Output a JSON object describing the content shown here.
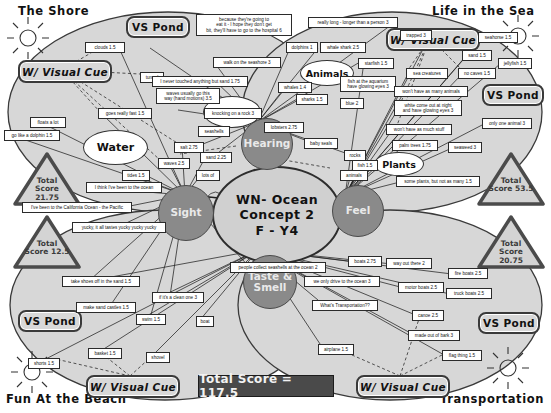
{
  "title": "WN- Ocean Concept 2 F - Y4",
  "corner_titles": [
    {
      "name": "the-shore",
      "label": "The Shore",
      "x": 18,
      "y": 4
    },
    {
      "name": "life-in-the-sea",
      "label": "Life in the Sea",
      "x": 432,
      "y": 4
    },
    {
      "name": "fun-at-the-beach",
      "label": "Fun At the Beach",
      "x": 6,
      "y": 392
    },
    {
      "name": "transportation",
      "label": "Transportation",
      "x": 440,
      "y": 392
    }
  ],
  "hub": {
    "line1": "WN- Ocean",
    "line2": "Concept 2",
    "line3": "F - Y4"
  },
  "senses": [
    {
      "name": "hearing",
      "label": "Hearing",
      "x": 241,
      "y": 118,
      "d": 50
    },
    {
      "name": "sight",
      "label": "Sight",
      "x": 158,
      "y": 185,
      "d": 54
    },
    {
      "name": "feel",
      "label": "Feel",
      "x": 332,
      "y": 185,
      "d": 50
    },
    {
      "name": "taste-and-smell",
      "label": "Taste &\nSmell",
      "x": 243,
      "y": 255,
      "d": 52
    }
  ],
  "concepts": [
    {
      "name": "water",
      "label": "Water",
      "x": 83,
      "y": 130,
      "w": 63,
      "h": 33
    },
    {
      "name": "land",
      "label": "Land",
      "x": 203,
      "y": 96,
      "w": 56,
      "h": 30
    },
    {
      "name": "animals",
      "label": "Animals",
      "x": 300,
      "y": 60,
      "w": 52,
      "h": 24
    },
    {
      "name": "plants",
      "label": "Plants",
      "x": 374,
      "y": 152,
      "w": 48,
      "h": 22
    }
  ],
  "plates": [
    {
      "name": "vs-pond-top-left",
      "label": "VS Pond",
      "x": 126,
      "y": 16,
      "w": 60,
      "h": 18,
      "kind": "vs"
    },
    {
      "name": "visual-cue-top-left",
      "label": "W/ Visual Cue",
      "x": 18,
      "y": 60,
      "w": 90,
      "h": 19,
      "kind": "cue"
    },
    {
      "name": "visual-cue-top-right",
      "label": "W/ Visual Cue",
      "x": 386,
      "y": 28,
      "w": 90,
      "h": 19,
      "kind": "cue"
    },
    {
      "name": "vs-pond-top-right",
      "label": "VS Pond",
      "x": 482,
      "y": 84,
      "w": 58,
      "h": 18,
      "kind": "vs"
    },
    {
      "name": "vs-pond-bottom-left",
      "label": "VS Pond",
      "x": 18,
      "y": 310,
      "w": 60,
      "h": 18,
      "kind": "vs"
    },
    {
      "name": "visual-cue-bottom-left",
      "label": "W/ Visual Cue",
      "x": 86,
      "y": 375,
      "w": 90,
      "h": 19,
      "kind": "cue"
    },
    {
      "name": "visual-cue-bottom-right",
      "label": "W/ Visual Cue",
      "x": 356,
      "y": 375,
      "w": 90,
      "h": 19,
      "kind": "cue"
    },
    {
      "name": "vs-pond-bottom-right",
      "label": "VS Pond",
      "x": 478,
      "y": 312,
      "w": 58,
      "h": 18,
      "kind": "vs"
    }
  ],
  "scores": [
    {
      "name": "score-the-shore",
      "label": "Total\nScore\n21.75",
      "x": 14,
      "y": 152,
      "w": 66,
      "h": 54
    },
    {
      "name": "score-life-in-the-sea",
      "label": "Total\nScore 53.5",
      "x": 478,
      "y": 152,
      "w": 66,
      "h": 54
    },
    {
      "name": "score-fun-at-the-beach",
      "label": "Total\nScore 12.5",
      "x": 14,
      "y": 215,
      "w": 66,
      "h": 54
    },
    {
      "name": "score-transportation",
      "label": "Total\nScore\n20.75",
      "x": 478,
      "y": 215,
      "w": 66,
      "h": 54
    }
  ],
  "banner": {
    "label": "Total Score = 117.5",
    "x": 198,
    "y": 375,
    "w": 134,
    "h": 20
  },
  "labels": [
    {
      "name": "label-clouds",
      "text": "clouds 1.5",
      "x": 85,
      "y": 42,
      "w": 40
    },
    {
      "name": "label-because-hospital",
      "text": "because they're going to\neat it - I hope they don't get\nbit, they'll have to go to the hospital 6",
      "x": 196,
      "y": 14,
      "w": 96
    },
    {
      "name": "label-really-long",
      "text": "really long - longer than a person 3",
      "x": 308,
      "y": 17,
      "w": 90
    },
    {
      "name": "label-trapped",
      "text": "trapped 3",
      "x": 400,
      "y": 30,
      "w": 32
    },
    {
      "name": "label-dolphins",
      "text": "dolphins 1",
      "x": 286,
      "y": 42,
      "w": 32
    },
    {
      "name": "label-whale-shark",
      "text": "whale shark 2.5",
      "x": 320,
      "y": 42,
      "w": 46
    },
    {
      "name": "label-seahorse",
      "text": "seahorse 1.5",
      "x": 478,
      "y": 32,
      "w": 40
    },
    {
      "name": "label-walk-seashore",
      "text": "walk on the seashore 3",
      "x": 213,
      "y": 57,
      "w": 68
    },
    {
      "name": "label-starfish",
      "text": "starfish 1.5",
      "x": 358,
      "y": 58,
      "w": 36
    },
    {
      "name": "label-sand-right",
      "text": "sand 1.5",
      "x": 462,
      "y": 50,
      "w": 30
    },
    {
      "name": "label-jellyfish",
      "text": "jellyfish 1.5",
      "x": 498,
      "y": 58,
      "w": 34
    },
    {
      "name": "label-tunnel",
      "text": "tunnel",
      "x": 140,
      "y": 72,
      "w": 24
    },
    {
      "name": "label-never-touched",
      "text": "I never touched anything but sand 1.75",
      "x": 152,
      "y": 76,
      "w": 96
    },
    {
      "name": "label-sea-creatures",
      "text": "sea creatures",
      "x": 406,
      "y": 68,
      "w": 42
    },
    {
      "name": "label-no-caves",
      "text": "no caves 1.5",
      "x": 458,
      "y": 68,
      "w": 38
    },
    {
      "name": "label-whales",
      "text": "whales 1.4",
      "x": 278,
      "y": 82,
      "w": 34
    },
    {
      "name": "label-aquarium-eyes",
      "text": "fish at the aquarium\nhave glowing eyes 3",
      "x": 340,
      "y": 76,
      "w": 56
    },
    {
      "name": "label-waves-hand",
      "text": "waves usually go this\nway (hand motions) 3.5",
      "x": 156,
      "y": 88,
      "w": 64
    },
    {
      "name": "label-sharks",
      "text": "sharks 1.5",
      "x": 296,
      "y": 94,
      "w": 32
    },
    {
      "name": "label-blue",
      "text": "blue 2",
      "x": 340,
      "y": 98,
      "w": 24
    },
    {
      "name": "label-wont-animals",
      "text": "won't have as many animals",
      "x": 394,
      "y": 86,
      "w": 74
    },
    {
      "name": "label-goes-really-fast",
      "text": "goes really fast 1.5",
      "x": 98,
      "y": 108,
      "w": 54
    },
    {
      "name": "label-knocking-rock",
      "text": "knocking on a rock 3",
      "x": 204,
      "y": 108,
      "w": 58
    },
    {
      "name": "label-white-night",
      "text": "white come out at night\nand have glowing eyes 3",
      "x": 394,
      "y": 100,
      "w": 68
    },
    {
      "name": "label-floats-a-lot",
      "text": "floats a lot",
      "x": 30,
      "y": 117,
      "w": 36
    },
    {
      "name": "label-only-one-animal",
      "text": "only one animal 3",
      "x": 482,
      "y": 118,
      "w": 50
    },
    {
      "name": "label-lobsters",
      "text": "lobsters 2.75",
      "x": 264,
      "y": 122,
      "w": 40
    },
    {
      "name": "label-seashells",
      "text": "seashells",
      "x": 198,
      "y": 126,
      "w": 32
    },
    {
      "name": "label-go-like-dolphin",
      "text": "go like a dolphin 1.5",
      "x": 4,
      "y": 130,
      "w": 56
    },
    {
      "name": "label-baby-seals",
      "text": "baby seals",
      "x": 304,
      "y": 138,
      "w": 34
    },
    {
      "name": "label-wont-much-stuff",
      "text": "won't have as much stuff",
      "x": 386,
      "y": 124,
      "w": 66
    },
    {
      "name": "label-salt",
      "text": "salt 2.75",
      "x": 174,
      "y": 142,
      "w": 30
    },
    {
      "name": "label-rocks",
      "text": "rocks",
      "x": 344,
      "y": 150,
      "w": 22
    },
    {
      "name": "label-palm-trees",
      "text": "palm trees 1.75",
      "x": 392,
      "y": 140,
      "w": 46
    },
    {
      "name": "label-fish",
      "text": "fish 1.5",
      "x": 352,
      "y": 160,
      "w": 26
    },
    {
      "name": "label-seaweed",
      "text": "seaweed 3",
      "x": 448,
      "y": 142,
      "w": 34
    },
    {
      "name": "label-sand-middle",
      "text": "sand 2.25",
      "x": 200,
      "y": 152,
      "w": 32
    },
    {
      "name": "label-waves",
      "text": "waves 2.5",
      "x": 158,
      "y": 158,
      "w": 32
    },
    {
      "name": "label-animals-small",
      "text": "animals",
      "x": 340,
      "y": 170,
      "w": 28
    },
    {
      "name": "label-tides",
      "text": "tides 1.5",
      "x": 122,
      "y": 170,
      "w": 28
    },
    {
      "name": "label-lots-of",
      "text": "lots of",
      "x": 196,
      "y": 170,
      "w": 24
    },
    {
      "name": "label-some-plants",
      "text": "some plants, but not as many 1.5",
      "x": 396,
      "y": 176,
      "w": 84
    },
    {
      "name": "label-think-been-ocean",
      "text": "I think I've been to the ocean",
      "x": 86,
      "y": 182,
      "w": 76
    },
    {
      "name": "label-california-ocean",
      "text": "I've been to the California Ocean - the Pacific",
      "x": 22,
      "y": 202,
      "w": 110
    },
    {
      "name": "label-yucky",
      "text": "yucky, it all tastes yucky yucky yucky",
      "x": 72,
      "y": 222,
      "w": 94
    },
    {
      "name": "label-people-collect",
      "text": "people collect seashells at the ocean 2",
      "x": 230,
      "y": 262,
      "w": 96
    },
    {
      "name": "label-way-out-there",
      "text": "way out there 2",
      "x": 386,
      "y": 258,
      "w": 46
    },
    {
      "name": "label-boats",
      "text": "boats 2.75",
      "x": 348,
      "y": 256,
      "w": 34
    },
    {
      "name": "label-fire-boats",
      "text": "fire boats 2.5",
      "x": 448,
      "y": 268,
      "w": 40
    },
    {
      "name": "label-take-shoes-off",
      "text": "take shoes off in the sand 1.5",
      "x": 62,
      "y": 276,
      "w": 78
    },
    {
      "name": "label-we-only-drive",
      "text": "we only drive to the ocean 3",
      "x": 304,
      "y": 276,
      "w": 76
    },
    {
      "name": "label-motor-boats",
      "text": "motor boats 2.5",
      "x": 398,
      "y": 282,
      "w": 46
    },
    {
      "name": "label-truck-boats",
      "text": "truck boats 2.5",
      "x": 446,
      "y": 288,
      "w": 46
    },
    {
      "name": "label-if-its-clean",
      "text": "if it's a clean one 3",
      "x": 152,
      "y": 292,
      "w": 52
    },
    {
      "name": "label-make-sand-castles",
      "text": "make sand castles 1.5",
      "x": 76,
      "y": 302,
      "w": 60
    },
    {
      "name": "label-whats-transportation",
      "text": "What's Transportation??",
      "x": 312,
      "y": 300,
      "w": 66
    },
    {
      "name": "label-canoe",
      "text": "canoe 2.5",
      "x": 412,
      "y": 310,
      "w": 32
    },
    {
      "name": "label-swim",
      "text": "swim 1.5",
      "x": 136,
      "y": 314,
      "w": 30
    },
    {
      "name": "label-boat-small",
      "text": "boat",
      "x": 196,
      "y": 316,
      "w": 18
    },
    {
      "name": "label-made-out-of-bark",
      "text": "made out of bark 3",
      "x": 408,
      "y": 330,
      "w": 52
    },
    {
      "name": "label-basket",
      "text": "basket 1.5",
      "x": 88,
      "y": 348,
      "w": 34
    },
    {
      "name": "label-airplane",
      "text": "airplane 1.5",
      "x": 318,
      "y": 344,
      "w": 36
    },
    {
      "name": "label-shovel",
      "text": "shovel",
      "x": 146,
      "y": 352,
      "w": 24
    },
    {
      "name": "label-flag-thing",
      "text": "flag thing 1.5",
      "x": 442,
      "y": 350,
      "w": 40
    },
    {
      "name": "label-shorts",
      "text": "shorts 1.5",
      "x": 28,
      "y": 358,
      "w": 32
    }
  ]
}
